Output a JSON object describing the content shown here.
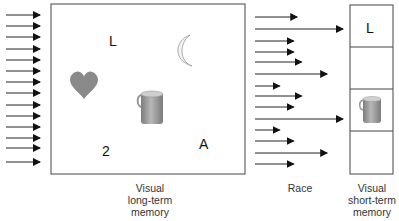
{
  "diagram": {
    "long_term_memory": {
      "label_lines": [
        "Visual",
        "long-term",
        "memory"
      ],
      "items": [
        {
          "kind": "letter",
          "text": "L"
        },
        {
          "kind": "icon",
          "name": "moon"
        },
        {
          "kind": "icon",
          "name": "heart"
        },
        {
          "kind": "icon",
          "name": "mug"
        },
        {
          "kind": "letter",
          "text": "2"
        },
        {
          "kind": "letter",
          "text": "A"
        }
      ]
    },
    "input_arrow_count": 14,
    "race": {
      "label": "Race",
      "arrow_lengths_relative": [
        0.48,
        1.0,
        0.44,
        0.44,
        0.53,
        0.82,
        0.28,
        0.53,
        0.44,
        1.0,
        0.28,
        0.44,
        0.82,
        0.44
      ]
    },
    "short_term_memory": {
      "label_lines": [
        "Visual",
        "short-term",
        "memory"
      ],
      "slots": [
        {
          "content": "letter",
          "text": "L"
        },
        {
          "content": "empty"
        },
        {
          "content": "icon",
          "name": "mug"
        },
        {
          "content": "empty"
        }
      ]
    },
    "colors": {
      "line": "#333333",
      "arrow": "#111111",
      "heart": "#8a8a8a",
      "mug": "#9a9a9a",
      "moon_stroke": "#b0b0b0"
    }
  }
}
